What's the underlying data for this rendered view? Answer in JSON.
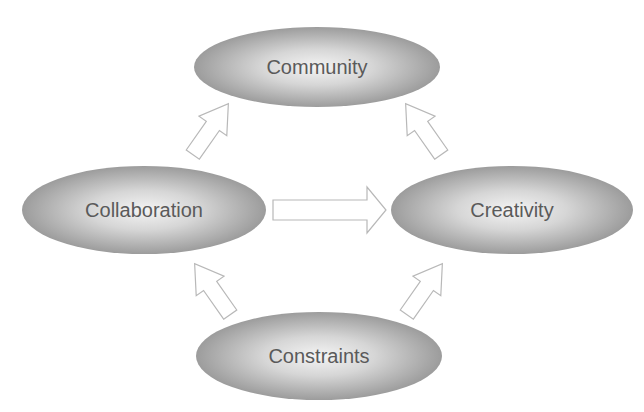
{
  "diagram": {
    "nodes": [
      {
        "id": "community",
        "label": "Community",
        "cx": 317,
        "cy": 67,
        "rx": 123,
        "ry": 40
      },
      {
        "id": "collaboration",
        "label": "Collaboration",
        "cx": 144,
        "cy": 210,
        "rx": 122,
        "ry": 44
      },
      {
        "id": "creativity",
        "label": "Creativity",
        "cx": 512,
        "cy": 210,
        "rx": 121,
        "ry": 44
      },
      {
        "id": "constraints",
        "label": "Constraints",
        "cx": 319,
        "cy": 356,
        "rx": 123,
        "ry": 44
      }
    ],
    "edges": [
      {
        "from": "collaboration",
        "to": "community",
        "style": "outlined-block-arrow"
      },
      {
        "from": "creativity",
        "to": "community",
        "style": "outlined-block-arrow"
      },
      {
        "from": "collaboration",
        "to": "creativity",
        "style": "outlined-block-arrow"
      },
      {
        "from": "constraints",
        "to": "collaboration",
        "style": "outlined-block-arrow"
      },
      {
        "from": "constraints",
        "to": "creativity",
        "style": "outlined-block-arrow"
      }
    ],
    "colors": {
      "ellipse_edge": "#9a9a9a",
      "ellipse_center": "#f2f2f2",
      "arrow_stroke": "#b8b8b8",
      "label": "#5a5a5a"
    }
  }
}
